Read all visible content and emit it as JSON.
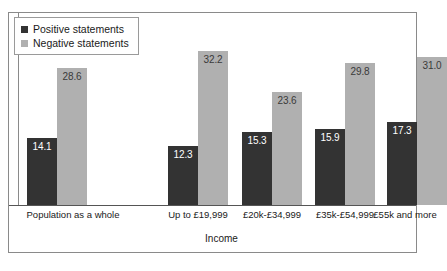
{
  "chart_data": {
    "type": "bar",
    "title": "",
    "xlabel": "Income",
    "ylabel": "",
    "ylim": [
      0,
      40
    ],
    "grid": false,
    "legend_position": "top-left",
    "categories": [
      "Population as a whole",
      "Up to £19,999",
      "£20k-£34,999",
      "£35k-£54,999",
      "£55k and more"
    ],
    "series": [
      {
        "name": "Positive statements",
        "color": "#333333",
        "values": [
          14.1,
          12.3,
          15.3,
          15.9,
          17.3
        ],
        "labels": [
          "14.1",
          "12.3",
          "15.3",
          "15.9",
          "17.3"
        ]
      },
      {
        "name": "Negative statements",
        "color": "#b0b0b0",
        "values": [
          28.6,
          32.2,
          23.6,
          29.8,
          31.0
        ],
        "labels": [
          "28.6",
          "32.2",
          "23.6",
          "29.8",
          "31.0"
        ]
      }
    ]
  },
  "legend": {
    "items": [
      {
        "label": "Positive statements",
        "swatch": "positive"
      },
      {
        "label": "Negative statements",
        "swatch": "negative"
      }
    ]
  },
  "axis": {
    "x_title": "Income"
  },
  "footnote": {
    "text": ""
  },
  "colors": {
    "positive": "#333333",
    "negative": "#b0b0b0",
    "frame": "#8a8a8a",
    "baseline": "#555555",
    "background": "#ffffff"
  }
}
